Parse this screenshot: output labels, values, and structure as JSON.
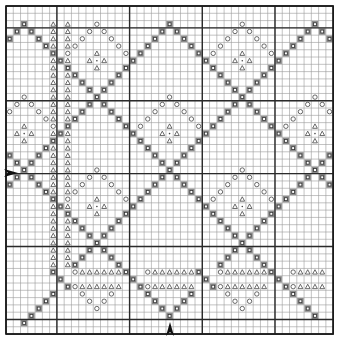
{
  "chart": {
    "grid": {
      "cols": 45,
      "rows": 45,
      "origin_x": 6,
      "origin_y": 6,
      "cell_w": 7.27,
      "cell_h": 7.29,
      "heavy_cols": [
        0,
        7,
        17,
        27,
        37,
        45
      ],
      "heavy_rows": [
        0,
        3,
        13,
        23,
        33,
        43,
        45
      ],
      "line_color": "#9a9a9a",
      "heavy_color": "#2a2a2a",
      "border_color": "#1a1a1a"
    },
    "symbols": {
      "square": {
        "name": "filled-square",
        "fill": "#8c8c8c",
        "inner": "#ffffff",
        "stroke": "#333333"
      },
      "circle": {
        "name": "open-circle",
        "stroke": "#444444"
      },
      "triangle": {
        "name": "open-triangle",
        "stroke": "#444444"
      },
      "dot": {
        "name": "center-dot",
        "fill": "#444444"
      }
    },
    "rules": {
      "square_diagonals": {
        "row_from": 2,
        "row_to": 35,
        "diff_mod": 20,
        "diff_val": 0,
        "sum_mod": 20,
        "sum_val": 4
      },
      "diamond_centers": [
        [
          12,
          7
        ],
        [
          32,
          7
        ],
        [
          12,
          27
        ],
        [
          32,
          27
        ],
        [
          2,
          17
        ],
        [
          22,
          17
        ],
        [
          42,
          17
        ]
      ],
      "circle_radius": 5,
      "triangle_columns": [
        6,
        8
      ],
      "triangle_col_rows": [
        2,
        35
      ]
    },
    "extra_cells": {
      "squares": [
        [
          16,
          36
        ],
        [
          17,
          37
        ],
        [
          18,
          38
        ],
        [
          6,
          36
        ],
        [
          7,
          37
        ],
        [
          8,
          38
        ],
        [
          26,
          36
        ],
        [
          27,
          37
        ],
        [
          28,
          38
        ],
        [
          36,
          36
        ],
        [
          37,
          37
        ],
        [
          38,
          38
        ],
        [
          2,
          43
        ],
        [
          3,
          42
        ],
        [
          4,
          41
        ],
        [
          5,
          40
        ],
        [
          6,
          39
        ],
        [
          22,
          42
        ],
        [
          21,
          41
        ],
        [
          20,
          40
        ],
        [
          19,
          39
        ],
        [
          23,
          41
        ],
        [
          24,
          40
        ],
        [
          25,
          39
        ],
        [
          42,
          42
        ],
        [
          41,
          41
        ],
        [
          40,
          40
        ],
        [
          39,
          39
        ]
      ],
      "circles": [
        [
          32,
          41
        ],
        [
          31,
          40
        ],
        [
          30,
          39
        ],
        [
          33,
          40
        ],
        [
          34,
          39
        ],
        [
          12,
          41
        ],
        [
          11,
          40
        ],
        [
          10,
          39
        ],
        [
          13,
          40
        ],
        [
          14,
          39
        ],
        [
          9,
          36
        ],
        [
          19,
          36
        ],
        [
          29,
          36
        ],
        [
          39,
          36
        ],
        [
          19,
          38
        ],
        [
          29,
          38
        ],
        [
          9,
          38
        ],
        [
          39,
          38
        ]
      ],
      "triangle_rows": [
        {
          "row": 36,
          "cols": [
            10,
            11,
            12,
            13,
            14,
            15,
            20,
            21,
            22,
            23,
            24,
            25,
            30,
            31,
            32,
            33,
            34,
            35,
            40,
            41,
            42,
            43
          ]
        },
        {
          "row": 38,
          "cols": [
            10,
            11,
            12,
            13,
            14,
            15,
            20,
            21,
            22,
            23,
            24,
            25,
            30,
            31,
            32,
            33,
            34,
            35,
            40,
            41,
            42,
            43
          ]
        }
      ]
    },
    "arrows": [
      {
        "name": "row-start-arrow",
        "direction": "right",
        "x": 4,
        "y": 173
      },
      {
        "name": "column-start-arrow",
        "direction": "up",
        "x": 170,
        "y": 336
      }
    ]
  }
}
